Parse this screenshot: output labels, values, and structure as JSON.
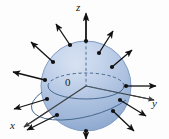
{
  "figure": {
    "kind": "3d-vector-field-diagram",
    "background_color": "#fdfdfd",
    "width": 169,
    "height": 139
  },
  "axes": {
    "origin_label": "0",
    "x_label": "x",
    "y_label": "y",
    "z_label": "z",
    "line_color": "#3a3a3a",
    "origin_point": [
      86,
      86
    ],
    "z_tip": [
      86,
      10
    ],
    "y_tip": [
      158,
      100
    ],
    "x_tip": [
      20,
      129
    ]
  },
  "sphere": {
    "center": [
      86,
      86
    ],
    "radius": 45,
    "fill_light": "#cfdcef",
    "fill_mid": "#b6c9e3",
    "fill_dark": "#8fa9ce",
    "outline_color": "#6f8cb5",
    "equator_solid_color": "#4a6b96",
    "equator_dashed_color": "#4a6b96"
  },
  "vectors": {
    "color": "#111111",
    "dot_color": "#111111",
    "count": 12,
    "description": "outward-pointing normal arrows from points on the sphere surface",
    "items": [
      {
        "name": "normal-arrow-1",
        "base": [
          53,
          62
        ],
        "tip": [
          31,
          42
        ]
      },
      {
        "name": "normal-arrow-2",
        "base": [
          99,
          53
        ],
        "tip": [
          113,
          31
        ]
      },
      {
        "name": "normal-arrow-3",
        "base": [
          112,
          67
        ],
        "tip": [
          132,
          50
        ]
      },
      {
        "name": "normal-arrow-4",
        "base": [
          45,
          80
        ],
        "tip": [
          13,
          72
        ]
      },
      {
        "name": "normal-arrow-5",
        "base": [
          47,
          99
        ],
        "tip": [
          14,
          109
        ]
      },
      {
        "name": "normal-arrow-6",
        "base": [
          57,
          115
        ],
        "tip": [
          27,
          130
        ]
      },
      {
        "name": "normal-arrow-7",
        "base": [
          113,
          111
        ],
        "tip": [
          134,
          131
        ]
      },
      {
        "name": "normal-arrow-8",
        "base": [
          86,
          131
        ],
        "tip": [
          86,
          139
        ]
      },
      {
        "name": "normal-arrow-9",
        "base": [
          126,
          86
        ],
        "tip": [
          156,
          86
        ]
      },
      {
        "name": "normal-arrow-10",
        "base": [
          86,
          41
        ],
        "tip": [
          86,
          14
        ]
      },
      {
        "name": "normal-arrow-11",
        "base": [
          70,
          45
        ],
        "tip": [
          56,
          24
        ]
      },
      {
        "name": "normal-arrow-12",
        "base": [
          120,
          100
        ],
        "tip": [
          146,
          116
        ]
      }
    ]
  }
}
